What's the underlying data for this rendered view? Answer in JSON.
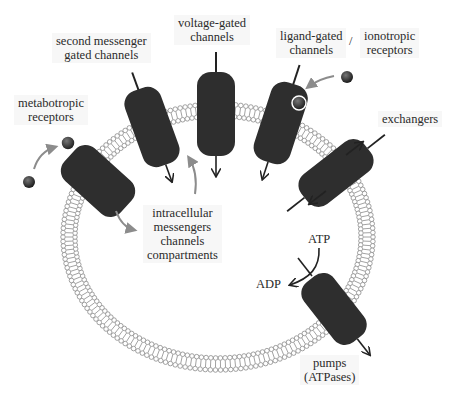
{
  "diagram": {
    "membrane": {
      "cx": 218,
      "cy": 237,
      "rx": 149,
      "ry": 127,
      "color": "#8a8a8a"
    },
    "channel_color": "#2e2e2e",
    "arrow_color": "#8c8c8c",
    "labels": {
      "second_messenger": [
        "second messenger",
        "gated channels"
      ],
      "voltage_gated": [
        "voltage-gated",
        "channels"
      ],
      "ligand_gated": [
        "ligand-gated",
        "channels"
      ],
      "separator": "/",
      "ionotropic": [
        "ionotropic",
        "receptors"
      ],
      "metabotropic": [
        "metabotropic",
        "receptors"
      ],
      "exchangers": "exchangers",
      "intracellular": [
        "intracellular",
        "messengers",
        "channels",
        "compartments"
      ],
      "atp": "ATP",
      "adp": "ADP",
      "pumps": [
        "pumps",
        "(ATPases)"
      ]
    }
  }
}
